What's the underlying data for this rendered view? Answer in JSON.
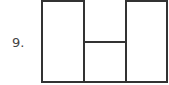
{
  "item": {
    "number_label": "9."
  },
  "figure": {
    "stroke_color": "#333333"
  }
}
